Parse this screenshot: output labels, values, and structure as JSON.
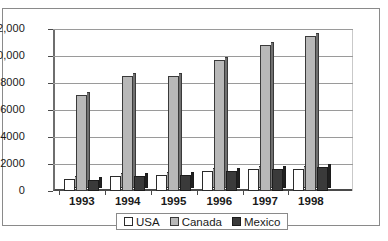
{
  "chart_data": {
    "type": "bar",
    "title": "",
    "subtitle": "",
    "xlabel": "",
    "ylabel": "",
    "categories": [
      "1993",
      "1994",
      "1995",
      "1996",
      "1997",
      "1998"
    ],
    "series": [
      {
        "name": "USA",
        "values": [
          900,
          1100,
          1200,
          1500,
          1600,
          1650
        ],
        "color": "#ffffff"
      },
      {
        "name": "Canada",
        "values": [
          7100,
          8500,
          8500,
          9700,
          10800,
          11500
        ],
        "color": "#b8b8b8"
      },
      {
        "name": "Mexico",
        "values": [
          800,
          1100,
          1200,
          1500,
          1600,
          1750
        ],
        "color": "#3a3a3a"
      }
    ],
    "ylim": [
      0,
      12000
    ],
    "yticks": [
      0,
      2000,
      4000,
      6000,
      8000,
      10000,
      12000
    ],
    "ytick_labels": [
      "0",
      "2000",
      "4000",
      "6000",
      "8000",
      "10,000",
      "12,000"
    ],
    "grid": true,
    "legend_position": "bottom"
  },
  "legend": {
    "items": [
      {
        "label": "USA",
        "swatch": "usa-swatch"
      },
      {
        "label": "Canada",
        "swatch": "canada-swatch"
      },
      {
        "label": "Mexico",
        "swatch": "mexico-swatch"
      }
    ]
  }
}
